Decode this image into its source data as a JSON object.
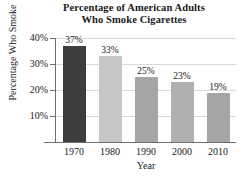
{
  "chart_data": {
    "type": "bar",
    "title": "Percentage of American Adults Who Smoke Cigarettes",
    "title_lines": [
      "Percentage of American Adults",
      "Who Smoke Cigarettes"
    ],
    "xlabel": "Year",
    "ylabel": "Percentage Who Smoke",
    "categories": [
      "1970",
      "1980",
      "1990",
      "2000",
      "2010"
    ],
    "values": [
      37,
      33,
      25,
      23,
      19
    ],
    "value_labels": [
      "37%",
      "33%",
      "25%",
      "23%",
      "19%"
    ],
    "bar_colors": [
      "#3d3d3d",
      "#c6c6c6",
      "#a5a5a5",
      "#b0b0b0",
      "#a5a5a5"
    ],
    "ylim": [
      0,
      40
    ],
    "yticks": [
      40,
      30,
      20,
      10
    ],
    "ytick_labels": [
      "40%",
      "30%",
      "20%",
      "10%"
    ],
    "grid": true,
    "grid_color": "#d9d9dd",
    "axis_color": "#6e6e74",
    "legend": null,
    "background": "#ffffff"
  }
}
